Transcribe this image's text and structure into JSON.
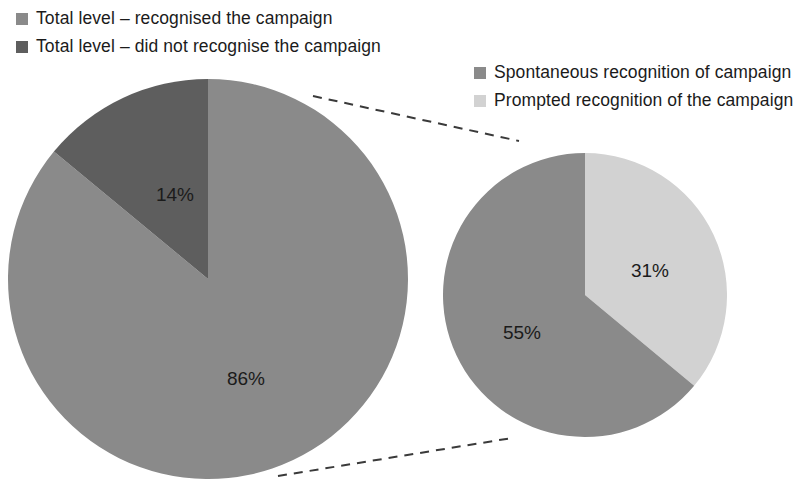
{
  "legend_left": {
    "items": [
      {
        "label": "Total level – recognised the campaign",
        "color": "#8a8a8a",
        "swatch_name": "legend-swatch-recognised"
      },
      {
        "label": "Total level – did not recognise the campaign",
        "color": "#5e5e5e",
        "swatch_name": "legend-swatch-not-recognised"
      }
    ]
  },
  "legend_right": {
    "items": [
      {
        "label": "Spontaneous recognition of campaign",
        "color": "#8a8a8a",
        "swatch_name": "legend-swatch-spontaneous"
      },
      {
        "label": "Prompted recognition of the campaign",
        "color": "#d2d2d2",
        "swatch_name": "legend-swatch-prompted"
      }
    ]
  },
  "labels": {
    "large_major": "86%",
    "large_minor": "14%",
    "small_major": "31%",
    "small_minor": "55%"
  },
  "colors": {
    "medium_gray": "#8a8a8a",
    "dark_gray": "#5e5e5e",
    "light_gray": "#d2d2d2",
    "dash_line": "#3a3a3a",
    "text": "#1b1b1b",
    "background": "#ffffff"
  },
  "chart_data": [
    {
      "type": "pie",
      "title": "",
      "name": "total-recognition-pie",
      "categories": [
        "Total level – recognised the campaign",
        "Total level – did not recognise the campaign"
      ],
      "values": [
        86,
        14
      ],
      "value_labels": [
        "86%",
        "14%"
      ],
      "colors": [
        "#8a8a8a",
        "#5e5e5e"
      ],
      "unit": "%",
      "start_angle_deg": 0,
      "direction": "clockwise",
      "legend_position": "top-left",
      "center": [
        208,
        279
      ],
      "radius": 200
    },
    {
      "type": "pie",
      "title": "",
      "name": "recognition-breakdown-pie",
      "categories": [
        "Prompted recognition of the campaign",
        "Spontaneous recognition of campaign"
      ],
      "values": [
        31,
        55
      ],
      "value_labels": [
        "31%",
        "55%"
      ],
      "colors": [
        "#d2d2d2",
        "#8a8a8a"
      ],
      "unit": "%",
      "start_angle_deg": 0,
      "direction": "clockwise",
      "legend_position": "top-right",
      "center": [
        585,
        295
      ],
      "radius": 142,
      "note": "Breakdown of the 86% who recognised the campaign"
    }
  ]
}
